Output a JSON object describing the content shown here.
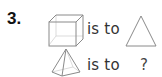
{
  "question": {
    "number": "3.",
    "row1": {
      "left_shape": "cube",
      "relation": "is to",
      "right_shape": "triangle"
    },
    "row2": {
      "left_shape": "pyramid",
      "relation": "is to",
      "answer": "?"
    }
  },
  "colors": {
    "stroke": "#8a8a8a",
    "hidden_edge": "#cfcfcf",
    "text": "#333333",
    "number": "#111111"
  }
}
